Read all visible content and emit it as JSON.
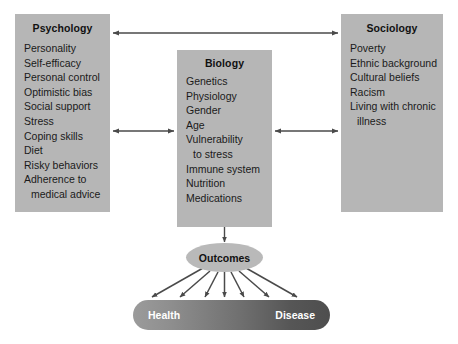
{
  "diagram": {
    "background_color": "#ffffff",
    "panel_fill": "#b6b6b6",
    "node_fill": "#b9b9b9",
    "arrow_color": "#4a4a4a",
    "bar_gradient_from": "#9b9b9b",
    "bar_gradient_to": "#4e4e4e",
    "bar_label_color": "#ffffff"
  },
  "panels": {
    "psychology": {
      "title": "Psychology",
      "items": [
        "Personality",
        "Self-efficacy",
        "Personal control",
        "Optimistic bias",
        "Social support",
        "Stress",
        "Coping skills",
        "Diet",
        "Risky behaviors",
        "Adherence to"
      ],
      "continuation": "medical advice"
    },
    "biology": {
      "title": "Biology",
      "items": [
        "Genetics",
        "Physiology",
        "Gender",
        "Age",
        "Vulnerability"
      ],
      "continuation": "to stress",
      "items_after": [
        "Immune system",
        "Nutrition",
        "Medications"
      ]
    },
    "sociology": {
      "title": "Sociology",
      "items": [
        "Poverty",
        "Ethnic background",
        "Cultural beliefs",
        "Racism",
        "Living with chronic"
      ],
      "continuation": "illness"
    }
  },
  "outcomes": {
    "label": "Outcomes"
  },
  "continuum": {
    "left_label": "Health",
    "right_label": "Disease"
  },
  "connectors": [
    {
      "name": "psychology-sociology",
      "style": "double-headed",
      "orientation": "horizontal"
    },
    {
      "name": "psychology-biology",
      "style": "double-headed",
      "orientation": "horizontal"
    },
    {
      "name": "biology-sociology",
      "style": "double-headed",
      "orientation": "horizontal"
    },
    {
      "name": "biology-outcomes",
      "style": "single-headed",
      "orientation": "vertical"
    },
    {
      "name": "outcomes-continuum-fan",
      "style": "single-headed",
      "orientation": "radial",
      "count": 7
    }
  ]
}
